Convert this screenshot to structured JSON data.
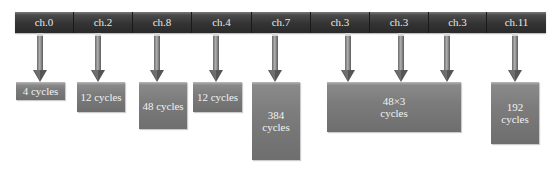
{
  "colors": {
    "bar_dark": "#333333",
    "box_gray": "#7c7c7c",
    "arrow_gray": "#7a7a7a",
    "text": "#f2f2f2"
  },
  "header": {
    "segments": [
      {
        "label": "ch.0",
        "left": 0,
        "width": 59
      },
      {
        "label": "ch.2",
        "left": 59,
        "width": 59
      },
      {
        "label": "ch.8",
        "left": 118,
        "width": 59
      },
      {
        "label": "ch.4",
        "left": 177,
        "width": 60
      },
      {
        "label": "ch.7",
        "left": 237,
        "width": 59
      },
      {
        "label": "ch.3",
        "left": 296,
        "width": 59
      },
      {
        "label": "ch.3",
        "left": 355,
        "width": 59
      },
      {
        "label": "ch.3",
        "left": 414,
        "width": 58
      },
      {
        "label": "ch.11",
        "left": 472,
        "width": 59
      }
    ]
  },
  "arrows": [
    {
      "channel": "ch.0",
      "x": 40
    },
    {
      "channel": "ch.2",
      "x": 98
    },
    {
      "channel": "ch.8",
      "x": 157
    },
    {
      "channel": "ch.4",
      "x": 216
    },
    {
      "channel": "ch.7",
      "x": 275
    },
    {
      "channel": "ch.3",
      "x": 348
    },
    {
      "channel": "ch.3",
      "x": 401
    },
    {
      "channel": "ch.3",
      "x": 447
    },
    {
      "channel": "ch.11",
      "x": 515
    }
  ],
  "boxes": [
    {
      "label": "4 cycles",
      "left": 16,
      "width": 49,
      "height": 18
    },
    {
      "label": "12 cycles",
      "left": 77,
      "width": 48,
      "height": 30
    },
    {
      "label": "48 cycles",
      "left": 139,
      "width": 48,
      "height": 47
    },
    {
      "label": "12 cycles",
      "left": 193,
      "width": 49,
      "height": 30
    },
    {
      "label": "384 cycles",
      "left": 252,
      "width": 48,
      "height": 78
    },
    {
      "label": "48×3\ncycles",
      "left": 327,
      "width": 134,
      "height": 50
    },
    {
      "label": "192 cycles",
      "left": 491,
      "width": 48,
      "height": 62
    }
  ]
}
